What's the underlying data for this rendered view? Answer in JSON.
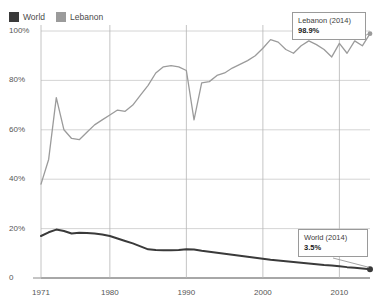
{
  "legend": {
    "position": "top-left",
    "items": [
      {
        "label": "World",
        "color": "#3a3a3a",
        "icon": "square-swatch-icon"
      },
      {
        "label": "Lebanon",
        "color": "#9b9b9b",
        "icon": "square-swatch-icon"
      }
    ]
  },
  "annotations": [
    {
      "id": "lebanon",
      "title": "Lebanon (2014)",
      "value": "98.9%",
      "point_year": 2014,
      "point_value": 98.9
    },
    {
      "id": "world",
      "title": "World (2014)",
      "value": "3.5%",
      "point_year": 2014,
      "point_value": 3.5
    }
  ],
  "chart_data": {
    "type": "line",
    "title": "",
    "subtitle": "",
    "xlabel": "",
    "ylabel": "",
    "xlim": [
      1971,
      2014
    ],
    "ylim": [
      0,
      100
    ],
    "grid": true,
    "legend_position": "top-left",
    "xticks": [
      1971,
      1980,
      1990,
      2000,
      2010
    ],
    "xtick_labels": [
      "1971",
      "1980",
      "1990",
      "2000",
      "2010"
    ],
    "yticks": [
      0,
      20,
      40,
      60,
      80,
      100
    ],
    "ytick_labels": [
      "0",
      "20%",
      "40%",
      "60%",
      "80%",
      "100%"
    ],
    "x": [
      1971,
      1972,
      1973,
      1974,
      1975,
      1976,
      1977,
      1978,
      1979,
      1980,
      1981,
      1982,
      1983,
      1984,
      1985,
      1986,
      1987,
      1988,
      1989,
      1990,
      1991,
      1992,
      1993,
      1994,
      1995,
      1996,
      1997,
      1998,
      1999,
      2000,
      2001,
      2002,
      2003,
      2004,
      2005,
      2006,
      2007,
      2008,
      2009,
      2010,
      2011,
      2012,
      2013,
      2014
    ],
    "series": [
      {
        "name": "Lebanon",
        "color": "#9b9b9b",
        "end_marker": true,
        "values": [
          38.0,
          48.0,
          73.0,
          60.0,
          56.5,
          56.0,
          59.0,
          62.0,
          64.0,
          66.0,
          68.0,
          67.5,
          70.0,
          74.0,
          78.0,
          83.0,
          85.5,
          86.0,
          85.5,
          84.0,
          64.0,
          79.0,
          79.5,
          82.0,
          83.0,
          85.0,
          86.5,
          88.0,
          90.0,
          93.0,
          96.5,
          95.5,
          92.5,
          91.0,
          94.0,
          96.0,
          94.5,
          92.5,
          89.5,
          95.0,
          91.0,
          96.0,
          94.0,
          98.9
        ]
      },
      {
        "name": "World",
        "color": "#3a3a3a",
        "end_marker": true,
        "values": [
          17.0,
          18.5,
          19.6,
          19.0,
          18.0,
          18.3,
          18.2,
          18.0,
          17.6,
          17.0,
          16.0,
          15.0,
          14.0,
          12.8,
          11.6,
          11.3,
          11.2,
          11.2,
          11.3,
          11.6,
          11.5,
          11.0,
          10.6,
          10.2,
          9.8,
          9.4,
          9.0,
          8.6,
          8.2,
          7.8,
          7.4,
          7.1,
          6.8,
          6.5,
          6.2,
          5.9,
          5.6,
          5.3,
          5.1,
          4.8,
          4.4,
          4.1,
          3.8,
          3.5
        ]
      }
    ]
  }
}
